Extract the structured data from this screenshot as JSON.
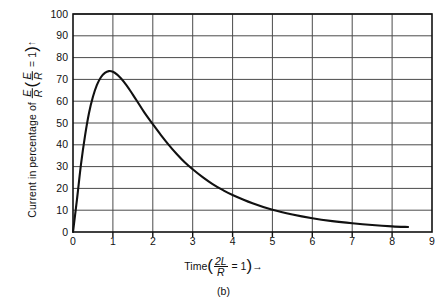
{
  "figure": {
    "caption": "(b)"
  },
  "axis": {
    "y_title_prefix": "Current in percentage of ",
    "y_title_frac_num": "E",
    "y_title_frac_den": "R",
    "y_title_paren_open": "(",
    "y_title_inner_num": "E",
    "y_title_inner_den": "R",
    "y_title_equals": " = 1",
    "y_title_paren_close": ")",
    "y_title_arrow": "↑",
    "x_title_prefix": "Time",
    "x_title_paren_open": "(",
    "x_title_frac_num": "2L",
    "x_title_frac_den": "R",
    "x_title_equals": " = 1",
    "x_title_paren_close": ")",
    "x_title_arrow": "→"
  },
  "chart_data": {
    "type": "line",
    "title": "",
    "xlabel": "Time (2L/R = 1)",
    "ylabel": "Current in percentage of E/R (E/R = 1)",
    "xlim": [
      0,
      9
    ],
    "ylim": [
      0,
      100
    ],
    "xticks": [
      0,
      1,
      2,
      3,
      4,
      5,
      6,
      7,
      8,
      9
    ],
    "yticks": [
      0,
      10,
      20,
      30,
      40,
      50,
      60,
      70,
      80,
      90,
      100
    ],
    "grid": true,
    "legend": "none",
    "series": [
      {
        "name": "Current",
        "x": [
          0.0,
          0.1,
          0.2,
          0.3,
          0.4,
          0.5,
          0.6,
          0.7,
          0.8,
          0.9,
          1.0,
          1.1,
          1.2,
          1.3,
          1.4,
          1.5,
          1.6,
          1.8,
          2.0,
          2.2,
          2.4,
          2.6,
          2.8,
          3.0,
          3.25,
          3.5,
          3.75,
          4.0,
          4.5,
          5.0,
          5.5,
          6.0,
          6.5,
          7.0,
          7.5,
          8.0,
          8.4
        ],
        "y": [
          0.0,
          15.0,
          31.0,
          44.0,
          54.5,
          62.0,
          67.5,
          71.0,
          73.0,
          73.8,
          73.5,
          72.3,
          70.5,
          68.3,
          65.8,
          63.0,
          60.2,
          54.5,
          49.5,
          44.6,
          40.0,
          35.8,
          32.0,
          28.8,
          25.2,
          22.0,
          19.3,
          17.0,
          13.2,
          10.2,
          8.0,
          6.3,
          5.0,
          4.0,
          3.2,
          2.6,
          2.3
        ]
      }
    ],
    "peak": {
      "x": 0.95,
      "y": 73.8
    }
  },
  "ytick_labels": [
    "100",
    "90",
    "80",
    "70",
    "60",
    "50",
    "40",
    "30",
    "20",
    "10",
    "0"
  ],
  "xtick_labels": [
    "0",
    "1",
    "2",
    "3",
    "4",
    "5",
    "6",
    "7",
    "8",
    "9"
  ],
  "colors": {
    "curve": "#111111",
    "grid": "#4a4a4a",
    "axis": "#111111",
    "background": "#ffffff",
    "text": "#111111"
  }
}
